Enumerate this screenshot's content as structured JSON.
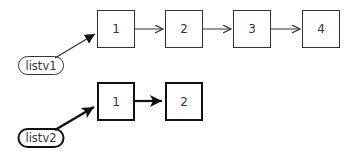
{
  "diagram": {
    "type": "linked-list-diagram",
    "lists": [
      {
        "name": "listv1",
        "style": "thin",
        "nodes": [
          "1",
          "2",
          "3",
          "4"
        ]
      },
      {
        "name": "listv2",
        "style": "bold",
        "nodes": [
          "1",
          "2"
        ]
      }
    ]
  },
  "colors": {
    "stroke": "#333333",
    "background": "#ffffff"
  }
}
